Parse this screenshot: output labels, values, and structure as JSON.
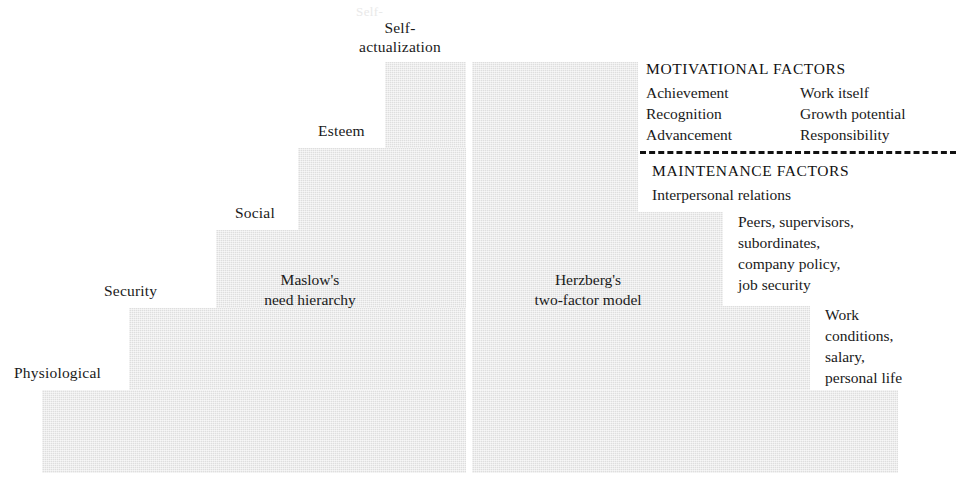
{
  "diagram": {
    "fill_color": "#dedede",
    "text_color": "#1a1a1a",
    "rule_color": "#111111"
  },
  "maslow": {
    "caption_line1": "Maslow's",
    "caption_line2": "need hierarchy",
    "steps": [
      {
        "label": "Physiological",
        "level": 1
      },
      {
        "label": "Security",
        "level": 2
      },
      {
        "label": "Social",
        "level": 3
      },
      {
        "label": "Esteem",
        "level": 4
      },
      {
        "label_line1": "Self-",
        "label_line2": "actualization",
        "level": 5
      }
    ]
  },
  "herzberg": {
    "caption_line1": "Herzberg's",
    "caption_line2": "two-factor model",
    "motivational": {
      "heading": "MOTIVATIONAL FACTORS",
      "column_left": [
        "Achievement",
        "Recognition",
        "Advancement"
      ],
      "column_right": [
        "Work itself",
        "Growth potential",
        "Responsibility"
      ]
    },
    "maintenance": {
      "heading": "MAINTENANCE FACTORS",
      "subhead": "Interpersonal relations",
      "group_middle": [
        "Peers, supervisors,",
        "subordinates,",
        "company policy,",
        "job security"
      ],
      "group_bottom": [
        "Work",
        "conditions,",
        "salary,",
        "personal life"
      ]
    }
  },
  "ghost_text": {
    "top": "Self-"
  }
}
